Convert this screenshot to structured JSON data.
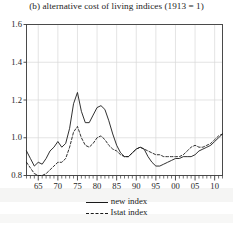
{
  "chart_data": {
    "type": "line",
    "title": "(b) alternative cost of living indices (1913 = 1)",
    "xlabel": "",
    "ylabel": "",
    "xlim": [
      1962,
      2012
    ],
    "ylim": [
      0.8,
      1.6
    ],
    "yticks": [
      "1.6",
      "1.4",
      "1.2",
      "1.0",
      "0.8"
    ],
    "ytick_values": [
      1.6,
      1.4,
      1.2,
      1.0,
      0.8
    ],
    "xticks": [
      "65",
      "70",
      "75",
      "80",
      "85",
      "90",
      "95",
      "00",
      "05",
      "10"
    ],
    "xtick_values": [
      1965,
      1970,
      1975,
      1980,
      1985,
      1990,
      1995,
      2000,
      2005,
      2010
    ],
    "grid": true,
    "legend_position": "below-axes",
    "minor_ticks": "annual",
    "series": [
      {
        "name": "new index",
        "style": "solid",
        "color": "#1a1a1a",
        "x": [
          1962,
          1963,
          1964,
          1965,
          1966,
          1967,
          1968,
          1969,
          1970,
          1971,
          1972,
          1973,
          1974,
          1975,
          1976,
          1977,
          1978,
          1979,
          1980,
          1981,
          1982,
          1983,
          1984,
          1985,
          1986,
          1987,
          1988,
          1989,
          1990,
          1991,
          1992,
          1993,
          1994,
          1995,
          1996,
          1997,
          1998,
          1999,
          2000,
          2001,
          2002,
          2003,
          2004,
          2005,
          2006,
          2007,
          2008,
          2009,
          2010,
          2011,
          2012
        ],
        "values": [
          0.93,
          0.89,
          0.85,
          0.87,
          0.86,
          0.89,
          0.93,
          0.95,
          0.98,
          0.95,
          0.97,
          1.05,
          1.18,
          1.24,
          1.14,
          1.08,
          1.08,
          1.12,
          1.16,
          1.17,
          1.15,
          1.09,
          1.02,
          0.96,
          0.92,
          0.9,
          0.9,
          0.92,
          0.94,
          0.95,
          0.94,
          0.9,
          0.87,
          0.85,
          0.85,
          0.86,
          0.87,
          0.88,
          0.89,
          0.89,
          0.9,
          0.9,
          0.9,
          0.91,
          0.93,
          0.94,
          0.95,
          0.96,
          0.98,
          1.0,
          1.02
        ]
      },
      {
        "name": "Istat index",
        "style": "dashed",
        "color": "#1a1a1a",
        "x": [
          1962,
          1963,
          1964,
          1965,
          1966,
          1967,
          1968,
          1969,
          1970,
          1971,
          1972,
          1973,
          1974,
          1975,
          1976,
          1977,
          1978,
          1979,
          1980,
          1981,
          1982,
          1983,
          1984,
          1985,
          1986,
          1987,
          1988,
          1989,
          1990,
          1991,
          1992,
          1993,
          1994,
          1995,
          1996,
          1997,
          1998,
          1999,
          2000,
          2001,
          2002,
          2003,
          2004,
          2005,
          2006,
          2007,
          2008,
          2009,
          2010,
          2011,
          2012
        ],
        "values": [
          0.87,
          0.84,
          0.81,
          0.8,
          0.8,
          0.81,
          0.83,
          0.85,
          0.87,
          0.87,
          0.89,
          0.95,
          1.03,
          1.06,
          1.0,
          0.96,
          0.95,
          0.97,
          1.0,
          1.01,
          0.99,
          0.96,
          0.94,
          0.93,
          0.91,
          0.9,
          0.9,
          0.92,
          0.94,
          0.95,
          0.94,
          0.93,
          0.92,
          0.91,
          0.91,
          0.9,
          0.9,
          0.9,
          0.9,
          0.9,
          0.91,
          0.93,
          0.95,
          0.96,
          0.95,
          0.95,
          0.96,
          0.97,
          0.99,
          1.01,
          1.02
        ]
      }
    ]
  },
  "legend": {
    "items": [
      {
        "label": "new index",
        "style": "solid"
      },
      {
        "label": "Istat index",
        "style": "dashed"
      }
    ]
  }
}
